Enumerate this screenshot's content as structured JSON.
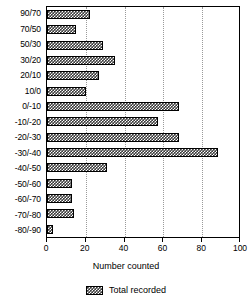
{
  "chart_data": {
    "type": "bar",
    "orientation": "horizontal",
    "title": "",
    "xlabel": "Number counted",
    "ylabel": "",
    "xlim": [
      0,
      100
    ],
    "xticks": [
      0,
      20,
      40,
      60,
      80,
      100
    ],
    "xtick_labels": [
      "0",
      "20",
      "40",
      "60",
      "80",
      "100"
    ],
    "grid": "vertical-dotted",
    "legend_position": "bottom-center",
    "categories": [
      "90/70",
      "70/50",
      "50/30",
      "30/20",
      "20/10",
      "10/0",
      "0/-10",
      "-10/-20",
      "-20/-30",
      "-30/-40",
      "-40/-50",
      "-50/-60",
      "-60/-70",
      "-70/-80",
      "-80/-90"
    ],
    "series": [
      {
        "name": "Total recorded",
        "color": "#3a3a3a",
        "values": [
          22,
          15,
          29,
          35,
          27,
          20,
          68,
          57,
          68,
          88,
          31,
          13,
          13,
          14,
          3
        ]
      }
    ]
  }
}
